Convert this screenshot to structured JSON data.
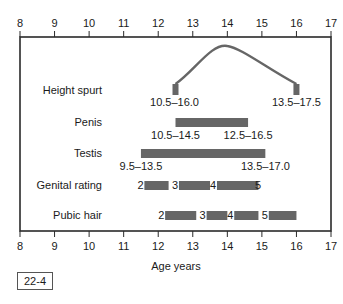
{
  "figure_id": "22-4",
  "chart_data": {
    "type": "bar",
    "subtype": "range-timeline",
    "title": "",
    "xlabel": "Age years",
    "ylabel": "",
    "xlim": [
      8,
      17
    ],
    "x_ticks": [
      8,
      9,
      10,
      11,
      12,
      13,
      14,
      15,
      16,
      17
    ],
    "ticks_top_and_bottom": true,
    "grid": false,
    "legend": null,
    "bar_color": "#666666",
    "rows": [
      {
        "label": "Height spurt",
        "kind": "curve",
        "onset_range": "10.5–16.0",
        "end_range": "13.5–17.5",
        "start_x": 12.5,
        "peak_x": 14.0,
        "end_x": 16.0
      },
      {
        "label": "Penis",
        "kind": "bar",
        "start": 12.5,
        "end": 14.6,
        "onset_range": "10.5–14.5",
        "end_range": "12.5–16.5"
      },
      {
        "label": "Testis",
        "kind": "bar",
        "start": 11.5,
        "end": 15.1,
        "onset_range": "9.5–13.5",
        "end_range": "13.5–17.0"
      },
      {
        "label": "Genital rating",
        "kind": "staged",
        "stages": [
          {
            "from_stage": "2",
            "start": 11.6,
            "end": 12.3
          },
          {
            "from_stage": "3",
            "start": 12.6,
            "end": 13.5
          },
          {
            "from_stage": "4",
            "start": 13.7,
            "end": 14.9
          },
          {
            "from_stage": "5",
            "start": 15.0,
            "end": null
          }
        ]
      },
      {
        "label": "Pubic hair",
        "kind": "staged",
        "stages": [
          {
            "from_stage": "2",
            "start": 12.2,
            "end": 13.1
          },
          {
            "from_stage": "3",
            "start": 13.4,
            "end": 14.0
          },
          {
            "from_stage": "4",
            "start": 14.2,
            "end": 14.9
          },
          {
            "from_stage": "5",
            "start": 15.2,
            "end": 16.0
          }
        ]
      }
    ]
  }
}
